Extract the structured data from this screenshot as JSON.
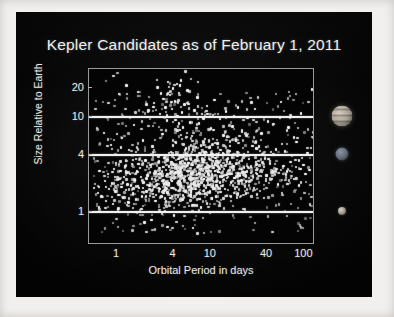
{
  "slide": {
    "background_color": "#060606",
    "border_color": "#f2f0ee"
  },
  "chart_data": {
    "type": "scatter",
    "title": "Kepler Candidates as of February 1, 2011",
    "xlabel": "Orbital Period in days",
    "ylabel": "Size Relative to Earth",
    "xscale": "log",
    "yscale": "log",
    "xlim": [
      0.5,
      130
    ],
    "ylim": [
      0.45,
      32
    ],
    "xticks": [
      1,
      4,
      10,
      40,
      100
    ],
    "xtick_labels": [
      "1",
      "4",
      "10",
      "40",
      "100"
    ],
    "yticks": [
      1,
      4,
      10,
      20
    ],
    "ytick_labels": [
      "1",
      "4",
      "10",
      "20"
    ],
    "grid": false,
    "point_color": "#e9e9e9",
    "reference_lines": [
      {
        "name": "jupiter-line",
        "y": 10,
        "label": "",
        "color": "#f0f0f0"
      },
      {
        "name": "neptune-line",
        "y": 4,
        "label": "",
        "color": "#f0f0f0"
      },
      {
        "name": "earth-line",
        "y": 1,
        "label": "",
        "color": "#f0f0f0"
      }
    ],
    "planet_markers": [
      {
        "name": "jupiter",
        "y": 10,
        "relative_size": 11.2
      },
      {
        "name": "neptune",
        "y": 4,
        "relative_size": 3.9
      },
      {
        "name": "earth",
        "y": 1,
        "relative_size": 1.0
      }
    ],
    "point_count_approx": 1235,
    "points": [
      [
        0.62,
        1.9
      ],
      [
        0.66,
        1.5
      ],
      [
        0.7,
        7.0
      ],
      [
        0.72,
        2.2
      ],
      [
        0.74,
        1.35
      ],
      [
        0.78,
        2.6
      ],
      [
        0.8,
        1.8
      ],
      [
        0.83,
        5.2
      ],
      [
        0.86,
        2.05
      ],
      [
        0.88,
        1.25
      ],
      [
        0.9,
        2.9
      ],
      [
        0.93,
        1.7
      ],
      [
        0.95,
        3.4
      ],
      [
        0.97,
        2.3
      ],
      [
        1.0,
        1.55
      ],
      [
        1.02,
        18.0
      ],
      [
        1.05,
        2.8
      ],
      [
        1.08,
        1.9
      ],
      [
        1.1,
        6.2
      ],
      [
        1.12,
        1.45
      ],
      [
        1.15,
        2.4
      ],
      [
        1.18,
        3.1
      ],
      [
        1.2,
        1.75
      ],
      [
        1.22,
        22.0
      ],
      [
        1.25,
        2.0
      ],
      [
        1.28,
        1.3
      ],
      [
        1.3,
        4.6
      ],
      [
        1.33,
        2.6
      ],
      [
        1.36,
        1.95
      ],
      [
        1.4,
        3.3
      ],
      [
        1.43,
        1.6
      ],
      [
        1.46,
        8.5
      ],
      [
        1.5,
        2.25
      ],
      [
        1.54,
        1.4
      ],
      [
        1.58,
        2.75
      ],
      [
        1.62,
        19.0
      ],
      [
        1.66,
        1.85
      ],
      [
        1.7,
        3.0
      ],
      [
        1.74,
        2.4
      ],
      [
        1.78,
        1.5
      ],
      [
        1.82,
        5.8
      ],
      [
        1.86,
        2.1
      ],
      [
        1.9,
        0.8
      ],
      [
        1.95,
        3.6
      ],
      [
        2.0,
        1.7
      ],
      [
        2.05,
        2.5
      ],
      [
        2.1,
        12.0
      ],
      [
        2.15,
        1.95
      ],
      [
        2.2,
        3.2
      ],
      [
        2.25,
        0.85
      ],
      [
        2.3,
        2.3
      ],
      [
        2.35,
        1.6
      ],
      [
        2.4,
        14.5
      ],
      [
        2.45,
        2.8
      ],
      [
        2.5,
        1.35
      ],
      [
        2.55,
        4.1
      ],
      [
        2.6,
        2.0
      ],
      [
        2.65,
        21.0
      ],
      [
        2.7,
        3.5
      ],
      [
        2.75,
        1.8
      ],
      [
        2.8,
        11.0
      ],
      [
        2.85,
        2.6
      ],
      [
        2.9,
        1.5
      ],
      [
        2.95,
        6.8
      ],
      [
        3.0,
        2.2
      ],
      [
        3.05,
        16.0
      ],
      [
        3.1,
        3.8
      ],
      [
        3.15,
        1.9
      ],
      [
        3.2,
        13.0
      ],
      [
        3.25,
        2.45
      ],
      [
        3.3,
        9.5
      ],
      [
        3.35,
        1.65
      ],
      [
        3.4,
        24.0
      ],
      [
        3.45,
        3.1
      ],
      [
        3.5,
        2.05
      ],
      [
        3.55,
        17.5
      ],
      [
        3.6,
        1.45
      ],
      [
        3.65,
        4.4
      ],
      [
        3.7,
        2.7
      ],
      [
        3.75,
        12.5
      ],
      [
        3.8,
        1.85
      ],
      [
        3.85,
        20.5
      ],
      [
        3.9,
        3.3
      ],
      [
        3.95,
        0.95
      ],
      [
        4.0,
        2.35
      ],
      [
        4.05,
        15.0
      ],
      [
        4.1,
        5.5
      ],
      [
        4.15,
        1.75
      ],
      [
        4.2,
        23.0
      ],
      [
        4.25,
        2.9
      ],
      [
        4.3,
        10.5
      ],
      [
        4.35,
        1.55
      ],
      [
        4.4,
        3.7
      ],
      [
        4.45,
        18.5
      ],
      [
        4.5,
        2.15
      ],
      [
        4.55,
        7.5
      ],
      [
        4.6,
        1.95
      ],
      [
        4.65,
        25.0
      ],
      [
        4.7,
        3.0
      ],
      [
        4.75,
        11.5
      ],
      [
        4.8,
        2.5
      ],
      [
        4.85,
        1.4
      ],
      [
        4.9,
        8.0
      ],
      [
        4.95,
        3.9
      ],
      [
        5.0,
        2.25
      ],
      [
        5.1,
        14.0
      ],
      [
        5.2,
        1.7
      ],
      [
        5.3,
        4.8
      ],
      [
        5.4,
        2.8
      ],
      [
        5.5,
        19.5
      ],
      [
        5.6,
        1.9
      ],
      [
        5.7,
        3.4
      ],
      [
        5.8,
        9.0
      ],
      [
        5.9,
        2.4
      ],
      [
        6.0,
        1.5
      ],
      [
        6.1,
        6.5
      ],
      [
        6.2,
        3.2
      ],
      [
        6.3,
        0.7
      ],
      [
        6.4,
        2.1
      ],
      [
        6.5,
        12.0
      ],
      [
        6.6,
        3.6
      ],
      [
        6.7,
        1.8
      ],
      [
        6.8,
        5.0
      ],
      [
        6.9,
        2.6
      ],
      [
        7.0,
        16.5
      ],
      [
        7.1,
        3.1
      ],
      [
        7.2,
        2.0
      ],
      [
        7.3,
        8.8
      ],
      [
        7.4,
        1.6
      ],
      [
        7.5,
        4.2
      ],
      [
        7.6,
        2.9
      ],
      [
        7.8,
        11.0
      ],
      [
        8.0,
        3.5
      ],
      [
        8.2,
        2.3
      ],
      [
        8.4,
        6.0
      ],
      [
        8.6,
        1.85
      ],
      [
        8.8,
        13.5
      ],
      [
        9.0,
        3.0
      ],
      [
        9.2,
        2.55
      ],
      [
        9.4,
        4.9
      ],
      [
        9.6,
        1.7
      ],
      [
        9.8,
        7.8
      ],
      [
        10.0,
        3.3
      ],
      [
        10.3,
        2.2
      ],
      [
        10.6,
        15.5
      ],
      [
        10.9,
        3.8
      ],
      [
        11.2,
        1.95
      ],
      [
        11.5,
        5.4
      ],
      [
        11.8,
        2.7
      ],
      [
        12.1,
        9.8
      ],
      [
        12.5,
        3.2
      ],
      [
        12.9,
        2.4
      ],
      [
        13.3,
        6.6
      ],
      [
        13.7,
        1.8
      ],
      [
        14.1,
        11.8
      ],
      [
        14.5,
        3.5
      ],
      [
        15.0,
        2.6
      ],
      [
        15.5,
        4.5
      ],
      [
        16.0,
        2.1
      ],
      [
        16.5,
        8.2
      ],
      [
        17.0,
        3.1
      ],
      [
        17.5,
        2.35
      ],
      [
        18.0,
        5.8
      ],
      [
        18.5,
        1.9
      ],
      [
        19.0,
        13.0
      ],
      [
        19.5,
        3.4
      ],
      [
        20.0,
        2.5
      ],
      [
        21.0,
        7.2
      ],
      [
        22.0,
        3.0
      ],
      [
        23.0,
        2.15
      ],
      [
        24.0,
        10.0
      ],
      [
        25.0,
        3.7
      ],
      [
        26.0,
        2.65
      ],
      [
        27.0,
        5.1
      ],
      [
        28.0,
        1.85
      ],
      [
        29.0,
        12.5
      ],
      [
        30.0,
        3.25
      ],
      [
        32.0,
        2.45
      ],
      [
        34.0,
        6.9
      ],
      [
        36.0,
        3.05
      ],
      [
        38.0,
        2.2
      ],
      [
        40.0,
        9.2
      ],
      [
        42.0,
        3.55
      ],
      [
        45.0,
        2.75
      ],
      [
        48.0,
        4.7
      ],
      [
        51.0,
        2.0
      ],
      [
        55.0,
        14.8
      ],
      [
        58.0,
        3.15
      ],
      [
        62.0,
        2.55
      ],
      [
        66.0,
        8.0
      ],
      [
        70.0,
        3.45
      ],
      [
        75.0,
        2.3
      ],
      [
        80.0,
        5.6
      ],
      [
        85.0,
        1.95
      ],
      [
        90.0,
        11.2
      ],
      [
        95.0,
        3.2
      ],
      [
        100.0,
        2.6
      ],
      [
        105.0,
        4.3
      ],
      [
        110.0,
        2.85
      ],
      [
        118.0,
        20.0
      ]
    ]
  },
  "axis_labels": {
    "x": "Orbital Period in days",
    "y": "Size Relative to Earth"
  }
}
